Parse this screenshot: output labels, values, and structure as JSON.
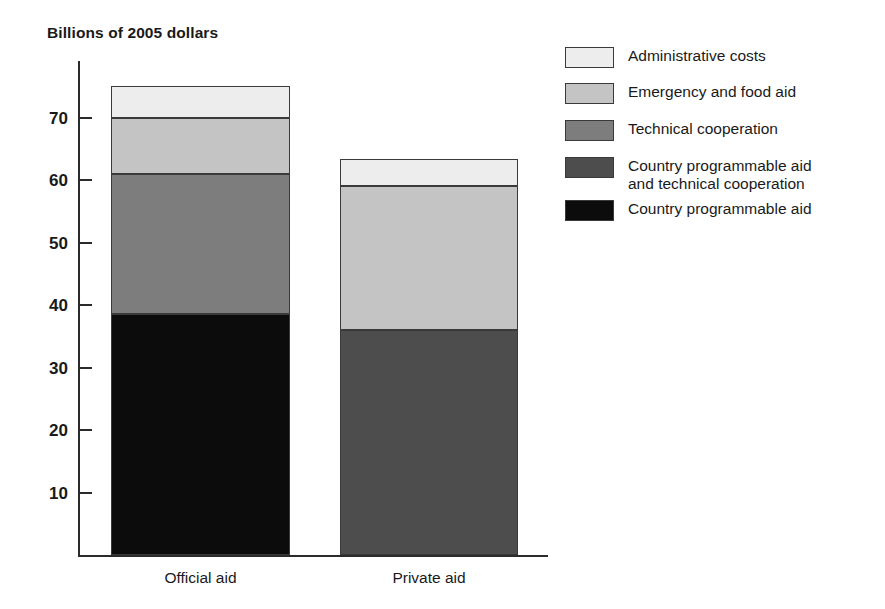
{
  "chart_data": {
    "type": "bar",
    "subtype": "stacked-vertical",
    "title": "",
    "axis_note": "Billions of 2005 dollars",
    "xlabel": "",
    "ylabel": "Billions of 2005 dollars",
    "categories": [
      "Official aid",
      "Private aid"
    ],
    "ylim": [
      0,
      78
    ],
    "yticks": [
      10,
      20,
      30,
      40,
      50,
      60,
      70
    ],
    "ytick_labels": [
      "10",
      "20",
      "30",
      "40",
      "50",
      "60",
      "70"
    ],
    "grid": false,
    "legend_position": "right",
    "series": [
      {
        "name": "Country programmable aid",
        "color": "#0c0c0c",
        "values": [
          38.5,
          0
        ]
      },
      {
        "name": "Country programmable aid and technical cooperation",
        "color": "#4d4d4d",
        "values": [
          0,
          36
        ]
      },
      {
        "name": "Technical cooperation",
        "color": "#7d7d7d",
        "values": [
          22.5,
          0
        ]
      },
      {
        "name": "Emergency and food aid",
        "color": "#c4c4c4",
        "values": [
          9,
          23
        ]
      },
      {
        "name": "Administrative costs",
        "color": "#ededed",
        "values": [
          5,
          4.4
        ]
      }
    ],
    "totals": [
      75,
      63.4
    ]
  },
  "legend": {
    "items": [
      {
        "label": "Administrative costs",
        "color": "#ededed"
      },
      {
        "label": "Emergency and food aid",
        "color": "#c4c4c4"
      },
      {
        "label": "Technical cooperation",
        "color": "#7d7d7d"
      },
      {
        "label": "Country programmable aid\nand technical cooperation",
        "color": "#4d4d4d"
      },
      {
        "label": "Country programmable aid",
        "color": "#0c0c0c"
      }
    ]
  },
  "axis": {
    "note": "Billions of 2005 dollars",
    "ticks": [
      "70",
      "60",
      "50",
      "40",
      "30",
      "20",
      "10"
    ]
  },
  "bars": [
    {
      "label": "Official aid",
      "segments": [
        {
          "name": "Administrative costs",
          "value": 5,
          "color": "#ededed"
        },
        {
          "name": "Emergency and food aid",
          "value": 9,
          "color": "#c4c4c4"
        },
        {
          "name": "Technical cooperation",
          "value": 22.5,
          "color": "#7d7d7d"
        },
        {
          "name": "Country programmable aid",
          "value": 38.5,
          "color": "#0c0c0c"
        }
      ]
    },
    {
      "label": "Private aid",
      "segments": [
        {
          "name": "Administrative costs",
          "value": 4.4,
          "color": "#ededed"
        },
        {
          "name": "Emergency and food aid",
          "value": 23,
          "color": "#c4c4c4"
        },
        {
          "name": "Country programmable aid and technical cooperation",
          "value": 36,
          "color": "#4d4d4d"
        }
      ]
    }
  ]
}
